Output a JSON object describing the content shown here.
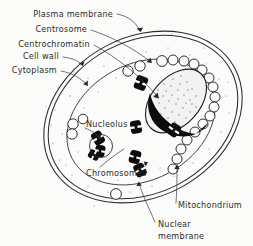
{
  "figure": {
    "background_color": "#fbfbfa",
    "ink_color": "#2b2b2b"
  },
  "labels": {
    "plasma_membrane": "Plasma membrane",
    "centrosome": "Centrosome",
    "centrochromatin": "Centrochromatin",
    "cell_wall": "Cell wall",
    "cytoplasm": "Cytoplasm",
    "nucleolus": "Nucleolus",
    "chromosomes": "Chromosomes",
    "mitochondrium": "Mitochondrium",
    "nuclear_membrane_line1": "Nuclear",
    "nuclear_membrane_line2": "membrane"
  },
  "structures": [
    {
      "name": "plasma-membrane",
      "shape": "outer-ellipse-outline"
    },
    {
      "name": "cell-wall",
      "shape": "inner-concentric-ellipse-outline"
    },
    {
      "name": "cytoplasm",
      "shape": "stippled-interior"
    },
    {
      "name": "nuclear-membrane",
      "shape": "inner-ellipse"
    },
    {
      "name": "nucleus",
      "shape": "stippled-lens"
    },
    {
      "name": "centrochromatin",
      "shape": "black-crescent"
    },
    {
      "name": "centrosome",
      "shape": "nucleus-upper-edge"
    },
    {
      "name": "nucleolus",
      "shape": "open-circle"
    },
    {
      "name": "mitochondria",
      "shape": "chain-of-open-circles",
      "count": 22
    },
    {
      "name": "chromosomes",
      "shape": "black-rod-bodies",
      "count": 8
    }
  ]
}
